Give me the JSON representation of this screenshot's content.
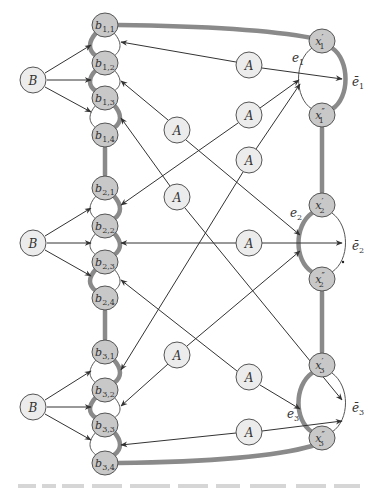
{
  "diagram": {
    "type": "graph-gadget-diagram",
    "colors": {
      "node_fill_B_A": "#ececec",
      "node_fill_b_x": "#c8c8c8",
      "node_stroke": "#555555",
      "thick_edge": "#8a8a8a",
      "thin_edge": "#444444"
    },
    "groups": [
      {
        "B_label": "B",
        "b_nodes": [
          {
            "base": "b",
            "sub": "1,1"
          },
          {
            "base": "b",
            "sub": "1,2"
          },
          {
            "base": "b",
            "sub": "1,3"
          },
          {
            "base": "b",
            "sub": "1,4"
          }
        ]
      },
      {
        "B_label": "B",
        "b_nodes": [
          {
            "base": "b",
            "sub": "2,1"
          },
          {
            "base": "b",
            "sub": "2,2"
          },
          {
            "base": "b",
            "sub": "2,3"
          },
          {
            "base": "b",
            "sub": "2,4"
          }
        ]
      },
      {
        "B_label": "B",
        "b_nodes": [
          {
            "base": "b",
            "sub": "3,1"
          },
          {
            "base": "b",
            "sub": "3,2"
          },
          {
            "base": "b",
            "sub": "3,3"
          },
          {
            "base": "b",
            "sub": "3,4"
          }
        ]
      }
    ],
    "x_nodes": [
      {
        "base": "x",
        "prime": "′",
        "sub": "1"
      },
      {
        "base": "x",
        "prime": "″",
        "sub": "1"
      },
      {
        "base": "x",
        "prime": "′",
        "sub": "2"
      },
      {
        "base": "x",
        "prime": "″",
        "sub": "2"
      },
      {
        "base": "x",
        "prime": "′",
        "sub": "3"
      },
      {
        "base": "x",
        "prime": "″",
        "sub": "3"
      }
    ],
    "edge_labels": [
      {
        "base": "e",
        "sub": "1"
      },
      {
        "base": "ē",
        "sub": "1"
      },
      {
        "base": "e",
        "sub": "2"
      },
      {
        "base": "ē",
        "sub": "2"
      },
      {
        "base": "e",
        "sub": "3"
      },
      {
        "base": "ē",
        "sub": "3"
      }
    ],
    "A_label": "A",
    "A_count": 9
  }
}
